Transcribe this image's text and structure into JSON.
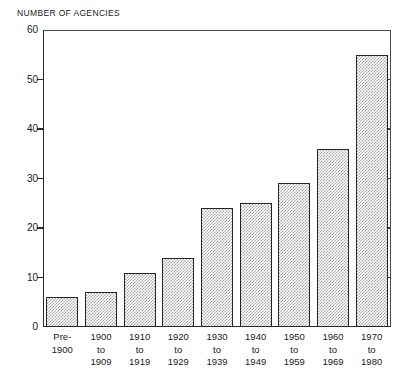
{
  "chart_data": {
    "type": "bar",
    "title": "NUMBER OF AGENCIES",
    "xlabel": "",
    "ylabel": "NUMBER OF AGENCIES",
    "ylim": [
      0,
      60
    ],
    "yticks": [
      0,
      10,
      20,
      30,
      40,
      50,
      60
    ],
    "grid": false,
    "legend": null,
    "categories": [
      "Pre-1900",
      "1900 to 1909",
      "1910 to 1919",
      "1920 to 1929",
      "1930 to 1939",
      "1940 to 1949",
      "1950 to 1959",
      "1960 to 1969",
      "1970 to 1980"
    ],
    "category_label_lines": [
      [
        "Pre-",
        "1900"
      ],
      [
        "1900",
        "to",
        "1909"
      ],
      [
        "1910",
        "to",
        "1919"
      ],
      [
        "1920",
        "to",
        "1929"
      ],
      [
        "1930",
        "to",
        "1939"
      ],
      [
        "1940",
        "to",
        "1949"
      ],
      [
        "1950",
        "to",
        "1959"
      ],
      [
        "1960",
        "to",
        "1969"
      ],
      [
        "1970",
        "to",
        "1980"
      ]
    ],
    "values": [
      6,
      7,
      11,
      14,
      24,
      25,
      29,
      36,
      55
    ],
    "bar_fill": "#a8a8a8",
    "bar_outline": "#262626",
    "axis_color": "#2a2a2a",
    "background": "#ffffff"
  },
  "axis": {
    "y_tick_labels": [
      "0",
      "10",
      "20",
      "30",
      "40",
      "50",
      "60"
    ]
  }
}
